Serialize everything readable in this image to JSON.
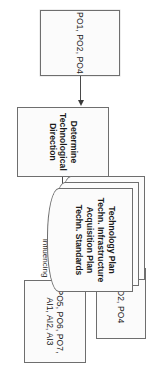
{
  "diagram": {
    "type": "process-flow",
    "orientation": "rotated-90-clockwise",
    "nodes": {
      "inputs": {
        "id": "inputs",
        "label": "PO1, PO2, PO4"
      },
      "process": {
        "id": "process",
        "label_line1": "Determine",
        "label_line2": "Technological Direction",
        "label": "Determine Technological Direction"
      },
      "outputs_primary": {
        "id": "outputs-primary",
        "label": "PO2, PO4"
      },
      "outputs_secondary": {
        "id": "outputs-secondary",
        "label_line1": "PO5, PO6, PO7,",
        "label_line2": "AI1, AI2, AI3",
        "label": "PO5, PO6, PO7, AI1, AI2, AI3"
      },
      "documents": {
        "id": "documents",
        "sheet_count": 3,
        "label_line1": "Technology Plan",
        "label_line2": "Techn. Infrastructure",
        "label_line3": "Acquisition Plan",
        "label_line4": "Techn. Standards"
      }
    },
    "edges": [
      {
        "id": "inputs-to-process",
        "from": "inputs",
        "to": "process",
        "label": ""
      },
      {
        "id": "process-to-outputs-primary",
        "from": "process",
        "to": "outputs_primary",
        "label_line1": "Technological",
        "label_line2": "Direction",
        "label": "Technological Direction"
      },
      {
        "id": "process-to-outputs-secondary",
        "from": "process",
        "to": "outputs_secondary",
        "label": "Influencing"
      },
      {
        "id": "process-to-documents",
        "from": "process",
        "to": "documents",
        "label": "Documents"
      }
    ],
    "colors": {
      "node_fill": "#fbfbfb",
      "node_border": "#6e6e6e",
      "edge": "#4a4a4a",
      "text": "#1a1a1a",
      "background": "#ffffff"
    }
  }
}
